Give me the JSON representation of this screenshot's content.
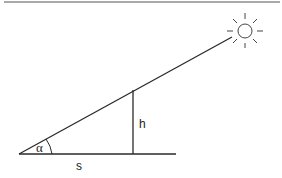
{
  "diagram": {
    "labels": {
      "angle": "α",
      "height": "h",
      "shadow": "s"
    },
    "elements": {
      "sun": "sun-icon",
      "sun_ray": "hypotenuse line from ground to sun",
      "pole": "vertical object of height h",
      "ground": "horizontal ground line (shadow length s)"
    },
    "colors": {
      "line": "#2a2a2a",
      "background": "#ffffff",
      "top_rule": "#555555"
    }
  }
}
